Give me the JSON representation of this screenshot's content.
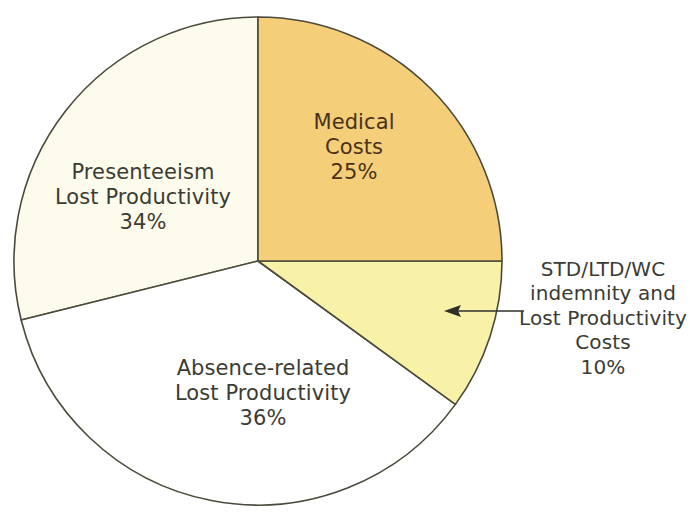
{
  "chart_data": {
    "type": "pie",
    "title": "",
    "subtitle": "",
    "xlabel": "",
    "ylabel": "",
    "legend_position": "none",
    "grid": false,
    "units": "percent",
    "total": 105,
    "start_angle_deg": 0,
    "direction": "clockwise",
    "categories": [
      "Medical Costs",
      "STD/LTD/WC indemnity and Lost Productivity Costs",
      "Absence-related Lost Productivity",
      "Presenteeism Lost Productivity"
    ],
    "values": [
      25,
      10,
      36,
      34
    ],
    "colors": [
      "#F5CE7A",
      "#F7F2A8",
      "#FFFFFF",
      "#FDFBEB"
    ],
    "slices": [
      {
        "id": "medical",
        "name": "Medical Costs",
        "value": 25,
        "value_label": "25%",
        "color": "#F5CE7A",
        "label_lines": [
          "Medical",
          "Costs"
        ],
        "label_placement": "inside",
        "start_angle_deg": 0,
        "end_angle_deg": 90
      },
      {
        "id": "std",
        "name": "STD/LTD/WC indemnity and Lost Productivity Costs",
        "value": 10,
        "value_label": "10%",
        "color": "#F7F2A8",
        "label_lines": [
          "STD/LTD/WC",
          "indemnity and",
          "Lost Productivity",
          "Costs"
        ],
        "label_placement": "callout",
        "start_angle_deg": 90,
        "end_angle_deg": 126
      },
      {
        "id": "absence",
        "name": "Absence-related Lost Productivity",
        "value": 36,
        "value_label": "36%",
        "color": "#FFFFFF",
        "label_lines": [
          "Absence-related",
          "Lost Productivity"
        ],
        "label_placement": "inside",
        "start_angle_deg": 126,
        "end_angle_deg": 256
      },
      {
        "id": "presenteeism",
        "name": "Presenteeism Lost Productivity",
        "value": 34,
        "value_label": "34%",
        "color": "#FDFBEB",
        "label_lines": [
          "Presenteeism",
          "Lost Productivity"
        ],
        "label_placement": "inside",
        "start_angle_deg": 256,
        "end_angle_deg": 360
      }
    ],
    "annotations": [
      {
        "id": "std-callout",
        "type": "arrow",
        "points_to_slice": "std",
        "direction": "left"
      }
    ],
    "style": {
      "wedge_stroke": "#4a4a3c",
      "text_dark": "#3b3b33",
      "text_on_gold": "#4a3118",
      "background": "#FFFFFF"
    }
  },
  "labels": {
    "medical": {
      "line1": "Medical",
      "line2": "Costs",
      "value": "25%"
    },
    "presenteeism": {
      "line1": "Presenteeism",
      "line2": "Lost Productivity",
      "value": "34%"
    },
    "absence": {
      "line1": "Absence-related",
      "line2": "Lost Productivity",
      "value": "36%"
    },
    "std": {
      "line1": "STD/LTD/WC",
      "line2": "indemnity and",
      "line3": "Lost Productivity",
      "line4": "Costs",
      "value": "10%"
    }
  }
}
